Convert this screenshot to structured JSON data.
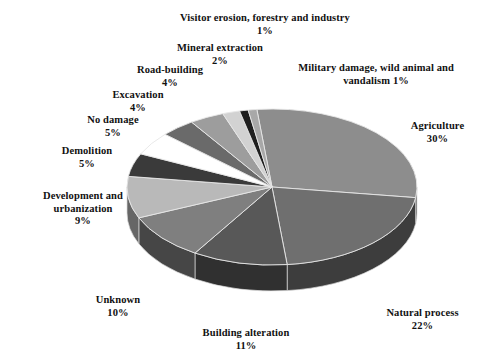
{
  "chart_data": {
    "type": "pie",
    "title": "",
    "subtitle": "",
    "xlabel": "",
    "ylabel": "",
    "legend_position": "labels-outside",
    "grid": false,
    "units": "%",
    "total": 100,
    "categories": [
      "Agriculture",
      "Natural process",
      "Building alteration",
      "Unknown",
      "Development and urbanization",
      "Demolition",
      "No damage",
      "Excavation",
      "Road-building",
      "Mineral extraction",
      "Visitor erosion, forestry and industry",
      "Military damage, wild animal and vandalism"
    ],
    "values": [
      30,
      22,
      11,
      10,
      9,
      5,
      5,
      4,
      4,
      2,
      1,
      1
    ],
    "colors": [
      "#8d8d8d",
      "#6f6f6f",
      "#585858",
      "#7f7f7f",
      "#b9b9b9",
      "#3a3a3a",
      "#ffffff",
      "#6a6a6a",
      "#9d9d9d",
      "#d2d2d2",
      "#1f1f1f",
      "#a8a8a8"
    ],
    "slices": [
      {
        "label": "Agriculture",
        "value": 30,
        "display": "30%",
        "color": "#8d8d8d"
      },
      {
        "label": "Natural process",
        "value": 22,
        "display": "22%",
        "color": "#6f6f6f"
      },
      {
        "label": "Building alteration",
        "value": 11,
        "display": "11%",
        "color": "#585858"
      },
      {
        "label": "Unknown",
        "value": 10,
        "display": "10%",
        "color": "#7f7f7f"
      },
      {
        "label": "Development and urbanization",
        "value": 9,
        "display": "9%",
        "color": "#b9b9b9"
      },
      {
        "label": "Demolition",
        "value": 5,
        "display": "5%",
        "color": "#3a3a3a"
      },
      {
        "label": "No damage",
        "value": 5,
        "display": "5%",
        "color": "#ffffff"
      },
      {
        "label": "Excavation",
        "value": 4,
        "display": "4%",
        "color": "#6a6a6a"
      },
      {
        "label": "Road-building",
        "value": 4,
        "display": "4%",
        "color": "#9d9d9d"
      },
      {
        "label": "Mineral extraction",
        "value": 2,
        "display": "2%",
        "color": "#d2d2d2"
      },
      {
        "label": "Visitor erosion, forestry and industry",
        "value": 1,
        "display": "1%",
        "color": "#1f1f1f"
      },
      {
        "label": "Military damage, wild animal and vandalism",
        "value": 1,
        "display": "1%",
        "color": "#a8a8a8"
      }
    ]
  },
  "labels": {
    "visitor_erosion": {
      "name": "Visitor erosion, forestry and industry",
      "pct": "1%"
    },
    "mineral_extraction": {
      "name": "Mineral extraction",
      "pct": "2%"
    },
    "road_building": {
      "name": "Road-building",
      "pct": "4%"
    },
    "excavation": {
      "name": "Excavation",
      "pct": "4%"
    },
    "no_damage": {
      "name": "No damage",
      "pct": "5%"
    },
    "demolition": {
      "name": "Demolition",
      "pct": "5%"
    },
    "development": {
      "name_line1": "Development and",
      "name_line2": "urbanization",
      "pct": "9%"
    },
    "unknown": {
      "name": "Unknown",
      "pct": "10%"
    },
    "building_alteration": {
      "name": "Building alteration",
      "pct": "11%"
    },
    "natural_process": {
      "name": "Natural process",
      "pct": "22%"
    },
    "agriculture": {
      "name": "Agriculture",
      "pct": "30%"
    },
    "military": {
      "name_line1": "Military damage, wild animal and",
      "name_line2": "vandalism 1%"
    }
  }
}
